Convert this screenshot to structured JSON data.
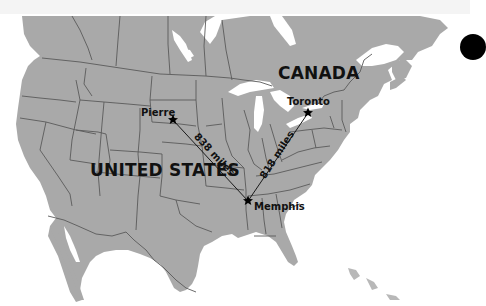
{
  "map": {
    "title": "",
    "colors": {
      "land": "#a9a9a9",
      "water": "#ffffff",
      "border": "#5a5a5a",
      "text": "#111111",
      "route": "#1a1a1a",
      "top_band": "#f4f4f4"
    },
    "countries": [
      {
        "label": "CANADA"
      },
      {
        "label": "UNITED STATES"
      }
    ],
    "cities": [
      {
        "label": "Pierre",
        "marker": "star-icon"
      },
      {
        "label": "Toronto",
        "marker": "star-icon"
      },
      {
        "label": "Memphis",
        "marker": "star-icon"
      }
    ],
    "routes": [
      {
        "from": "Pierre",
        "to": "Memphis",
        "label": "838 miles"
      },
      {
        "from": "Toronto",
        "to": "Memphis",
        "label": "818 miles"
      }
    ]
  }
}
